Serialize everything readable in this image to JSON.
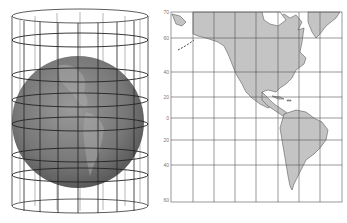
{
  "figure": {
    "left_panel": {
      "name": "cylinder-projection-illustration",
      "description": "Globe inside a transparent cylinder with graticule",
      "globe_color": "#7a7a7a",
      "cylinder_line_color": "#333333"
    },
    "right_panel": {
      "name": "mercator-map",
      "land_color": "#c4c4c4",
      "grid_color": "#555555",
      "latitude_labels": [
        {
          "label": "70",
          "y": 12
        },
        {
          "label": "60",
          "y": 38
        },
        {
          "label": "40",
          "y": 72
        },
        {
          "label": "20",
          "y": 97
        },
        {
          "label": "0",
          "y": 118
        },
        {
          "label": "20",
          "y": 140
        },
        {
          "label": "40",
          "y": 165
        },
        {
          "label": "60",
          "y": 200
        }
      ]
    }
  }
}
